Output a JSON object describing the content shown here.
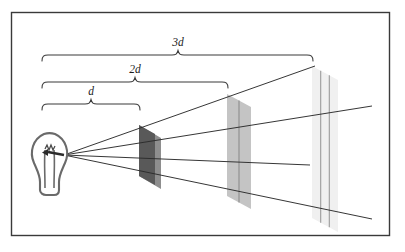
{
  "figure": {
    "kind": "physics-diagram",
    "background_color": "#ffffff",
    "border_color": "#3a3a3a",
    "line_color": "#2b2b2b",
    "border": {
      "x": 11,
      "y": 12,
      "width": 379,
      "height": 224
    }
  },
  "labels": {
    "d": "d",
    "two_d": "2d",
    "three_d": "3d"
  },
  "braces": [
    {
      "name": "brace-d",
      "label": "d",
      "x1": 42,
      "x2": 140,
      "y": 104,
      "label_x": 91,
      "label_y": 96
    },
    {
      "name": "brace-2d",
      "label": "2d",
      "x1": 42,
      "x2": 228,
      "y": 82,
      "label_x": 135,
      "label_y": 73
    },
    {
      "name": "brace-3d",
      "label": "3d",
      "x1": 42,
      "x2": 313,
      "y": 55,
      "label_x": 178,
      "label_y": 46
    }
  ],
  "source": {
    "name": "light-bulb",
    "origin_x": 64,
    "origin_y": 155,
    "outline_color": "#555555",
    "filament_color": "#444444"
  },
  "panels": [
    {
      "name": "panel-1d",
      "label": "d",
      "fill": "#595959",
      "side_fill": "#8f8f8f",
      "x": 139,
      "top_y": 125,
      "bottom_y": 176,
      "width": 22,
      "slant": 13,
      "grid_cells": 1,
      "relative_area": 1,
      "relative_intensity": "1"
    },
    {
      "name": "panel-2d",
      "label": "2d",
      "fill": "#c2c2c2",
      "side_fill": "#d6d6d6",
      "x": 227,
      "top_y": 94,
      "bottom_y": 196,
      "width": 24,
      "slant": 26,
      "grid_cells": 4,
      "relative_area": 4,
      "relative_intensity": "1/4"
    },
    {
      "name": "panel-3d",
      "label": "3d",
      "fill": "#efefef",
      "side_fill": "#f6f6f6",
      "x": 312,
      "top_y": 66,
      "bottom_y": 218,
      "width": 26,
      "slant": 38,
      "grid_cells": 9,
      "relative_area": 9,
      "relative_intensity": "1/9"
    }
  ],
  "rays": [
    {
      "name": "ray-top",
      "x1": 64,
      "y1": 155,
      "x2": 315,
      "y2": 66
    },
    {
      "name": "ray-upper-mid",
      "x1": 64,
      "y1": 155,
      "x2": 372,
      "y2": 106
    },
    {
      "name": "ray-lower-mid",
      "x1": 64,
      "y1": 155,
      "x2": 310,
      "y2": 165
    },
    {
      "name": "ray-bottom",
      "x1": 64,
      "y1": 155,
      "x2": 372,
      "y2": 219
    }
  ]
}
